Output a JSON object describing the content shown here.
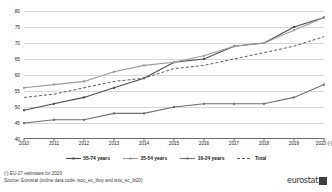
{
  "chart_data": {
    "type": "line",
    "title": "",
    "subtitle": "",
    "xlabel": "",
    "ylabel": "",
    "ylim": [
      40,
      80
    ],
    "yticks": [
      40,
      45,
      50,
      55,
      60,
      65,
      70,
      75,
      80
    ],
    "grid": true,
    "legend_position": "bottom",
    "categories": [
      "2010",
      "2011",
      "2012",
      "2013",
      "2014",
      "2015",
      "2016",
      "2017",
      "2018",
      "2019",
      "2020 (¹)"
    ],
    "x": [
      2010,
      2011,
      2012,
      2013,
      2014,
      2015,
      2016,
      2017,
      2018,
      2019,
      2020
    ],
    "series": [
      {
        "name": "55-74 years",
        "style": "solid",
        "color": "#4a4a4a",
        "values": [
          49,
          51,
          53,
          56,
          59,
          64,
          65,
          69,
          70,
          75,
          78
        ]
      },
      {
        "name": "35-54 years",
        "style": "solid",
        "color": "#9a9a9a",
        "values": [
          56,
          57,
          58,
          61,
          63,
          64,
          66,
          69,
          70,
          74,
          78
        ]
      },
      {
        "name": "16-24 years",
        "style": "solid",
        "color": "#6e6e6e",
        "values": [
          45,
          46,
          46,
          48,
          48,
          50,
          51,
          51,
          51,
          53,
          57
        ]
      },
      {
        "name": "Total",
        "style": "dashed",
        "color": "#5a5a5a",
        "values": [
          53,
          54,
          56,
          58,
          59,
          62,
          63,
          65,
          67,
          69,
          72
        ]
      }
    ]
  },
  "legend": {
    "items": [
      {
        "label": "55-74 years"
      },
      {
        "label": "35-54 years"
      },
      {
        "label": "16-24 years"
      },
      {
        "label": "Total"
      }
    ]
  },
  "footer": {
    "note": "(¹) EU-27 estimates for 2020",
    "source": "Source: Eurostat (online data code:  isoc_ec_ibuy and isoc_ec_ib20)"
  },
  "brand": {
    "name": "eurostat"
  }
}
